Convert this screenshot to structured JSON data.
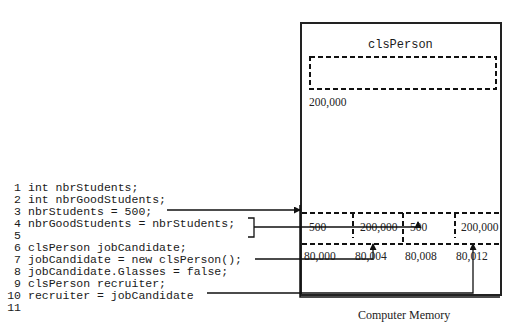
{
  "code": {
    "lines": [
      {
        "num": "1",
        "text": "int nbrStudents;"
      },
      {
        "num": "2",
        "text": "int nbrGoodStudents;"
      },
      {
        "num": "3",
        "text": "nbrStudents = 500;"
      },
      {
        "num": "4",
        "text": "nbrGoodStudents = nbrStudents;"
      },
      {
        "num": "5",
        "text": ""
      },
      {
        "num": "6",
        "text": "clsPerson jobCandidate;"
      },
      {
        "num": "7",
        "text": "jobCandidate = new clsPerson();"
      },
      {
        "num": "8",
        "text": "jobCandidate.Glasses = false;"
      },
      {
        "num": "9",
        "text": "clsPerson recruiter;"
      },
      {
        "num": "10",
        "text": "recruiter = jobCandidate"
      },
      {
        "num": "11",
        "text": ""
      }
    ]
  },
  "memory": {
    "caption": "Computer Memory",
    "heap_object": {
      "class_label": "clsPerson",
      "address": "200,000"
    },
    "cells": [
      {
        "value": "500",
        "address": "80,000"
      },
      {
        "value": "200,000",
        "address": "80,004"
      },
      {
        "value": "500",
        "address": "80,008"
      },
      {
        "value": "200,000",
        "address": "80,012"
      }
    ]
  },
  "arrows": [
    {
      "from_line": "3",
      "to_address": "80,000"
    },
    {
      "from_line": "4",
      "to_address": "80,008"
    },
    {
      "from_line": "7",
      "to_address": "80,004"
    },
    {
      "from_line": "10",
      "to_address": "80,012"
    }
  ]
}
